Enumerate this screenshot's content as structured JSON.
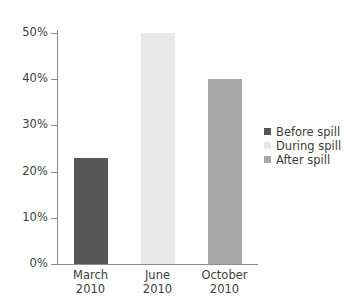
{
  "chart_data": {
    "type": "bar",
    "title": "",
    "subtitle": "",
    "xlabel": "",
    "ylabel": "",
    "categories": [
      "March\n2010",
      "June\n2010",
      "October\n2010"
    ],
    "category_lines": [
      {
        "month": "March",
        "year": "2010"
      },
      {
        "month": "June",
        "year": "2010"
      },
      {
        "month": "October",
        "year": "2010"
      }
    ],
    "values": [
      23,
      50,
      40
    ],
    "value_labels": [
      "23%",
      "50%",
      "40%"
    ],
    "bar_colors": [
      "#565656",
      "#e8e8e8",
      "#a8a8a8"
    ],
    "ylim": [
      0,
      50
    ],
    "yticks": [
      0,
      10,
      20,
      30,
      40,
      50
    ],
    "ytick_labels": [
      "0%",
      "10%",
      "20%",
      "30%",
      "40%",
      "50%"
    ],
    "grid": false,
    "legend_position": "right",
    "legend": [
      {
        "label": "Before spill",
        "color": "#565656"
      },
      {
        "label": "During spill",
        "color": "#e8e8e8"
      },
      {
        "label": "After spill",
        "color": "#a8a8a8"
      }
    ],
    "axis_color": "#8d8d8d",
    "text_color": "#3d3d3d",
    "background": "#ffffff"
  }
}
